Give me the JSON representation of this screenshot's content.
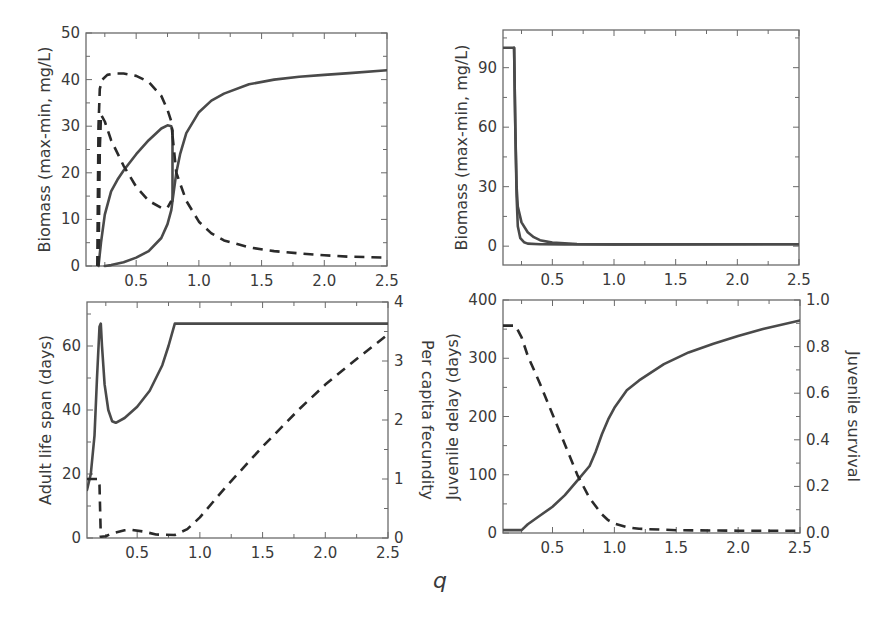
{
  "figure": {
    "shared_xlabel": "q"
  },
  "chart_data": [
    {
      "id": "top-left",
      "type": "line",
      "title": "",
      "xlabel": "",
      "ylabel": "Biomass (max-min, mg/L)",
      "xlim": [
        0.1,
        2.5
      ],
      "ylim": [
        0,
        50
      ],
      "xticks": [
        0.5,
        1.0,
        1.5,
        2.0,
        2.5
      ],
      "xtick_labels": [
        "0.5",
        "1.0",
        "1.5",
        "2.0",
        "2.5"
      ],
      "yticks": [
        0,
        10,
        20,
        30,
        40,
        50
      ],
      "ytick_labels": [
        "0",
        "10",
        "20",
        "30",
        "40",
        "50"
      ],
      "grid": false,
      "series": [
        {
          "name": "solid upper branch",
          "style": "solid",
          "x": [
            0.2,
            0.22,
            0.25,
            0.3,
            0.35,
            0.4,
            0.5,
            0.6,
            0.7,
            0.75,
            0.78,
            0.79
          ],
          "y": [
            0,
            5,
            11,
            16,
            18.5,
            20.5,
            24,
            27,
            29.5,
            30.2,
            30,
            29
          ]
        },
        {
          "name": "solid lower branch",
          "style": "solid",
          "x": [
            0.25,
            0.3,
            0.4,
            0.5,
            0.6,
            0.7,
            0.75,
            0.78,
            0.79,
            0.79
          ],
          "y": [
            0,
            0.2,
            0.8,
            1.8,
            3.2,
            6,
            9,
            12,
            14,
            29
          ]
        },
        {
          "name": "solid high-q",
          "style": "solid",
          "x": [
            0.79,
            0.82,
            0.85,
            0.9,
            1.0,
            1.1,
            1.2,
            1.4,
            1.6,
            1.8,
            2.0,
            2.2,
            2.5
          ],
          "y": [
            14,
            20,
            24,
            28.5,
            33,
            35.5,
            37,
            39,
            40,
            40.6,
            41,
            41.4,
            42
          ]
        },
        {
          "name": "dashed max",
          "style": "dashed",
          "x": [
            0.19,
            0.2,
            0.21,
            0.23,
            0.27,
            0.33,
            0.4,
            0.5,
            0.6,
            0.7,
            0.75,
            0.78,
            0.79
          ],
          "y": [
            0,
            30,
            38,
            40,
            41,
            41.3,
            41.3,
            40.8,
            39.5,
            36.5,
            33.5,
            31,
            28
          ]
        },
        {
          "name": "dashed min",
          "style": "dashed",
          "x": [
            0.2,
            0.21,
            0.22,
            0.25,
            0.3,
            0.4,
            0.5,
            0.6,
            0.7,
            0.75,
            0.78
          ],
          "y": [
            0,
            25,
            32.5,
            31,
            27,
            21.5,
            17,
            14,
            12.5,
            12.5,
            14
          ]
        },
        {
          "name": "dashed high-q",
          "style": "dashed",
          "x": [
            0.79,
            0.82,
            0.9,
            1.0,
            1.1,
            1.2,
            1.4,
            1.6,
            1.8,
            2.0,
            2.2,
            2.5
          ],
          "y": [
            28,
            20,
            14,
            9.5,
            7,
            5.5,
            4,
            3.2,
            2.7,
            2.3,
            2.0,
            1.8
          ]
        }
      ]
    },
    {
      "id": "top-right",
      "type": "line",
      "title": "",
      "xlabel": "",
      "ylabel": "Biomass (max-min, mg/L)",
      "xlim": [
        0.1,
        2.5
      ],
      "ylim": [
        -9.5,
        109
      ],
      "xticks": [
        0.5,
        1.0,
        1.5,
        2.0,
        2.5
      ],
      "xtick_labels": [
        "0.5",
        "1.0",
        "1.5",
        "2.0",
        "2.5"
      ],
      "yticks": [
        0,
        30,
        60,
        90
      ],
      "ytick_labels": [
        "0",
        "30",
        "60",
        "90"
      ],
      "grid": false,
      "series": [
        {
          "name": "upper curve",
          "style": "solid",
          "x": [
            0.1,
            0.19,
            0.2,
            0.21,
            0.22,
            0.25,
            0.3,
            0.35,
            0.4,
            0.5,
            0.7,
            1.0,
            2.5
          ],
          "y": [
            100,
            100,
            60,
            30,
            20,
            12,
            7,
            4.5,
            3,
            1.8,
            1.1,
            0.9,
            1
          ]
        },
        {
          "name": "lower curve",
          "style": "solid",
          "x": [
            0.19,
            0.2,
            0.21,
            0.22,
            0.24,
            0.27,
            0.3,
            0.4,
            0.6,
            1.0,
            2.5
          ],
          "y": [
            100,
            60,
            25,
            10,
            4,
            2,
            1.3,
            1,
            0.9,
            0.9,
            1
          ]
        }
      ]
    },
    {
      "id": "bottom-left",
      "type": "line",
      "title": "",
      "xlabel": "",
      "ylabel": "Adult life span (days)",
      "ylabel_right": "Per capita fecundity",
      "xlim": [
        0.1,
        2.5
      ],
      "ylim": [
        0,
        73.75
      ],
      "ylim_right": [
        0,
        4
      ],
      "xticks": [
        0.5,
        1.0,
        1.5,
        2.0,
        2.5
      ],
      "xtick_labels": [
        "0.5",
        "1.0",
        "1.5",
        "2.0",
        "2.5"
      ],
      "yticks": [
        0,
        20,
        40,
        60
      ],
      "ytick_labels": [
        "0",
        "20",
        "40",
        "60"
      ],
      "yticks_right": [
        0,
        1,
        2,
        3,
        4
      ],
      "ytick_labels_right": [
        "0",
        "1",
        "2",
        "3",
        "4"
      ],
      "grid": false,
      "series": [
        {
          "name": "Adult life span",
          "style": "solid",
          "axis": "left",
          "x": [
            0.1,
            0.13,
            0.16,
            0.18,
            0.2,
            0.21,
            0.22,
            0.24,
            0.27,
            0.3,
            0.33,
            0.4,
            0.5,
            0.6,
            0.7,
            0.75,
            0.8,
            2.5
          ],
          "y": [
            15,
            20,
            32,
            50,
            66,
            67,
            60,
            48,
            40,
            36.5,
            36,
            37.5,
            41,
            46,
            54,
            60,
            67,
            67
          ]
        },
        {
          "name": "Per capita fecundity",
          "style": "dashed",
          "axis": "right",
          "x": [
            0.1,
            0.19,
            0.2,
            0.21,
            0.25,
            0.3,
            0.4,
            0.45,
            0.55,
            0.65,
            0.8,
            0.9,
            1.0,
            1.2,
            1.5,
            1.8,
            2.0,
            2.2,
            2.5
          ],
          "y": [
            1.0,
            1.0,
            0.9,
            0.02,
            0.03,
            0.08,
            0.13,
            0.14,
            0.11,
            0.06,
            0.05,
            0.15,
            0.35,
            0.85,
            1.55,
            2.2,
            2.6,
            2.95,
            3.45
          ]
        }
      ]
    },
    {
      "id": "bottom-right",
      "type": "line",
      "title": "",
      "xlabel": "",
      "ylabel": "Juvenile delay (days)",
      "ylabel_right": "Juvenile survival",
      "xlim": [
        0.1,
        2.5
      ],
      "ylim": [
        0,
        400
      ],
      "ylim_right": [
        0,
        1.0
      ],
      "xticks": [
        0.5,
        1.0,
        1.5,
        2.0,
        2.5
      ],
      "xtick_labels": [
        "0.5",
        "1.0",
        "1.5",
        "2.0",
        "2.5"
      ],
      "yticks": [
        0,
        100,
        200,
        300,
        400
      ],
      "ytick_labels": [
        "0",
        "100",
        "200",
        "300",
        "400"
      ],
      "yticks_right": [
        0,
        0.2,
        0.4,
        0.6,
        0.8,
        1.0
      ],
      "ytick_labels_right": [
        "0.0",
        "0.2",
        "0.4",
        "0.6",
        "0.8",
        "1.0"
      ],
      "grid": false,
      "series": [
        {
          "name": "Juvenile delay",
          "style": "solid",
          "axis": "left",
          "x": [
            0.1,
            0.25,
            0.3,
            0.4,
            0.5,
            0.6,
            0.7,
            0.8,
            0.85,
            0.9,
            0.95,
            1.0,
            1.1,
            1.2,
            1.4,
            1.6,
            1.8,
            2.0,
            2.2,
            2.5
          ],
          "y": [
            5,
            5,
            15,
            30,
            45,
            65,
            90,
            115,
            140,
            170,
            195,
            215,
            245,
            262,
            290,
            310,
            325,
            338,
            350,
            365
          ]
        },
        {
          "name": "Juvenile survival",
          "style": "dashed",
          "axis": "right",
          "x": [
            0.1,
            0.2,
            0.25,
            0.3,
            0.4,
            0.5,
            0.6,
            0.7,
            0.8,
            0.9,
            0.95,
            1.0,
            1.1,
            1.2,
            1.5,
            2.0,
            2.5
          ],
          "y": [
            0.89,
            0.89,
            0.84,
            0.76,
            0.64,
            0.51,
            0.38,
            0.25,
            0.15,
            0.08,
            0.055,
            0.04,
            0.025,
            0.018,
            0.012,
            0.01,
            0.01
          ]
        }
      ]
    }
  ]
}
